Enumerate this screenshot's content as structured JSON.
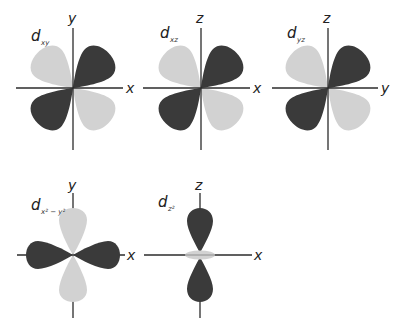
{
  "figure": {
    "colors": {
      "dark_lobe": "#3a3a3a",
      "light_lobe": "#d2d2d2",
      "axis": "#2b2b2b",
      "background": "#ffffff"
    },
    "panels": [
      {
        "id": "dxy",
        "label_main": "d",
        "label_sub": "xy",
        "horizontal_axis": "x",
        "vertical_axis": "y",
        "shape": "cloverleaf-diagonal",
        "lobes": {
          "NE": "dark",
          "SW": "dark",
          "NW": "light",
          "SE": "light"
        }
      },
      {
        "id": "dxz",
        "label_main": "d",
        "label_sub": "xz",
        "horizontal_axis": "x",
        "vertical_axis": "z",
        "shape": "cloverleaf-diagonal",
        "lobes": {
          "NE": "dark",
          "SW": "dark",
          "NW": "light",
          "SE": "light"
        }
      },
      {
        "id": "dyz",
        "label_main": "d",
        "label_sub": "yz",
        "horizontal_axis": "y",
        "vertical_axis": "z",
        "shape": "cloverleaf-diagonal",
        "lobes": {
          "NE": "dark",
          "SW": "dark",
          "NW": "light",
          "SE": "light"
        }
      },
      {
        "id": "dx2-y2",
        "label_main": "d",
        "label_sub": "x² − y²",
        "horizontal_axis": "x",
        "vertical_axis": "y",
        "shape": "cloverleaf-on-axis",
        "lobes": {
          "E": "dark",
          "W": "dark",
          "N": "light",
          "S": "light"
        }
      },
      {
        "id": "dz2",
        "label_main": "d",
        "label_sub": "z²",
        "horizontal_axis": "x",
        "vertical_axis": "z",
        "shape": "dumbbell-with-torus",
        "lobes": {
          "N": "dark",
          "S": "dark",
          "torus": "light"
        }
      }
    ]
  }
}
